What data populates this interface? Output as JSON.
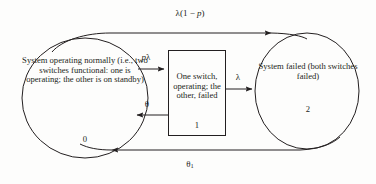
{
  "diagram": {
    "background_color": "#fdfdfc",
    "stroke_color": "#231f20",
    "states": [
      {
        "id": "0",
        "shape": "ellipse",
        "label": "System operating normally (i.e., two switches functional: one is operating; the other is on standby)",
        "number": "0"
      },
      {
        "id": "1",
        "shape": "rectangle",
        "label": "One switch, operating; the other, failed",
        "number": "1"
      },
      {
        "id": "2",
        "shape": "ellipse",
        "label": "System failed (both switches failed)",
        "number": "2"
      }
    ],
    "transitions": [
      {
        "id": "t0-2",
        "from": "0",
        "to": "2",
        "label": "λ(1 − p)",
        "label_plain": "lambda(1 - p)",
        "position": "top"
      },
      {
        "id": "t0-1",
        "from": "0",
        "to": "1",
        "label": "pλ",
        "label_plain": "p lambda",
        "position": "upper-middle"
      },
      {
        "id": "t1-0",
        "from": "1",
        "to": "0",
        "label": "θ",
        "label_plain": "theta",
        "position": "lower-middle"
      },
      {
        "id": "t1-2",
        "from": "1",
        "to": "2",
        "label": "λ",
        "label_plain": "lambda",
        "position": "middle-right"
      },
      {
        "id": "t2-0",
        "from": "2",
        "to": "0",
        "label": "θ₁",
        "label_plain": "theta 1",
        "position": "bottom"
      }
    ]
  }
}
